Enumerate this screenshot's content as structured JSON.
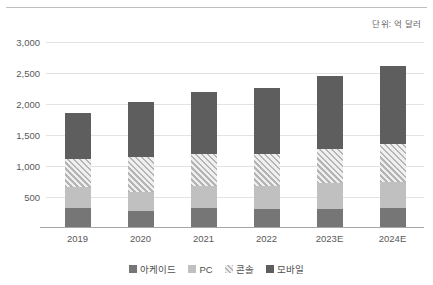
{
  "unit_note": "단위: 억 달러",
  "chart_data": {
    "type": "bar",
    "subtype": "stacked-column",
    "title": "",
    "xlabel": "",
    "ylabel": "",
    "ylim": [
      0,
      3000
    ],
    "ytick_interval": 500,
    "grid": true,
    "legend_position": "bottom-center",
    "unit": "억 달러",
    "categories": [
      "2019",
      "2020",
      "2021",
      "2022",
      "2023E",
      "2024E"
    ],
    "ytick_labels": [
      "3,000",
      "2,500",
      "2,000",
      "1,500",
      "1,000",
      "500"
    ],
    "ytick_values": [
      3000,
      2500,
      2000,
      1500,
      1000,
      500
    ],
    "stack_order_bottom_to_top": [
      "아케이드",
      "PC",
      "콘솔",
      "모바일"
    ],
    "series": [
      {
        "name": "아케이드",
        "color": "#767676",
        "values": [
          330,
          270,
          315,
          305,
          310,
          320
        ]
      },
      {
        "name": "PC",
        "color": "#c0c0c0",
        "values": [
          330,
          315,
          355,
          375,
          420,
          430
        ]
      },
      {
        "name": "콘솔",
        "color": "#b4b4b4",
        "pattern": "diagonal-hatch",
        "values": [
          450,
          555,
          530,
          520,
          550,
          600
        ]
      },
      {
        "name": "모바일",
        "color": "#5e5e5e",
        "values": [
          740,
          900,
          1000,
          1065,
          1170,
          1265
        ]
      }
    ],
    "totals": [
      1850,
      2040,
      2200,
      2265,
      2450,
      2615
    ]
  },
  "legend": {
    "items": [
      {
        "label": "아케이드",
        "key": "arcade"
      },
      {
        "label": "PC",
        "key": "pc"
      },
      {
        "label": "콘솔",
        "key": "console"
      },
      {
        "label": "모바일",
        "key": "mobile"
      }
    ]
  }
}
